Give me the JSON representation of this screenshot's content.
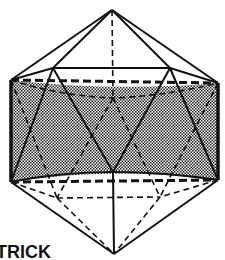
{
  "figure": {
    "caption_text": "TRICK",
    "colors": {
      "stroke": "#111111",
      "shade": "#8a8a8a",
      "background": "#ffffff"
    },
    "vertices": {
      "top_apex": [
        112,
        10
      ],
      "upper_back_left": [
        53,
        68
      ],
      "upper_back_right": [
        170,
        68
      ],
      "upper_front_left": [
        11,
        80
      ],
      "upper_front_right": [
        218,
        83
      ],
      "upper_back_center": [
        113,
        98
      ],
      "lower_front_center": [
        113,
        172
      ],
      "lower_front_left": [
        11,
        182
      ],
      "lower_front_right": [
        218,
        180
      ],
      "lower_back_left": [
        57,
        198
      ],
      "lower_back_right": [
        160,
        197
      ],
      "bottom_apex": [
        114,
        254
      ]
    }
  }
}
